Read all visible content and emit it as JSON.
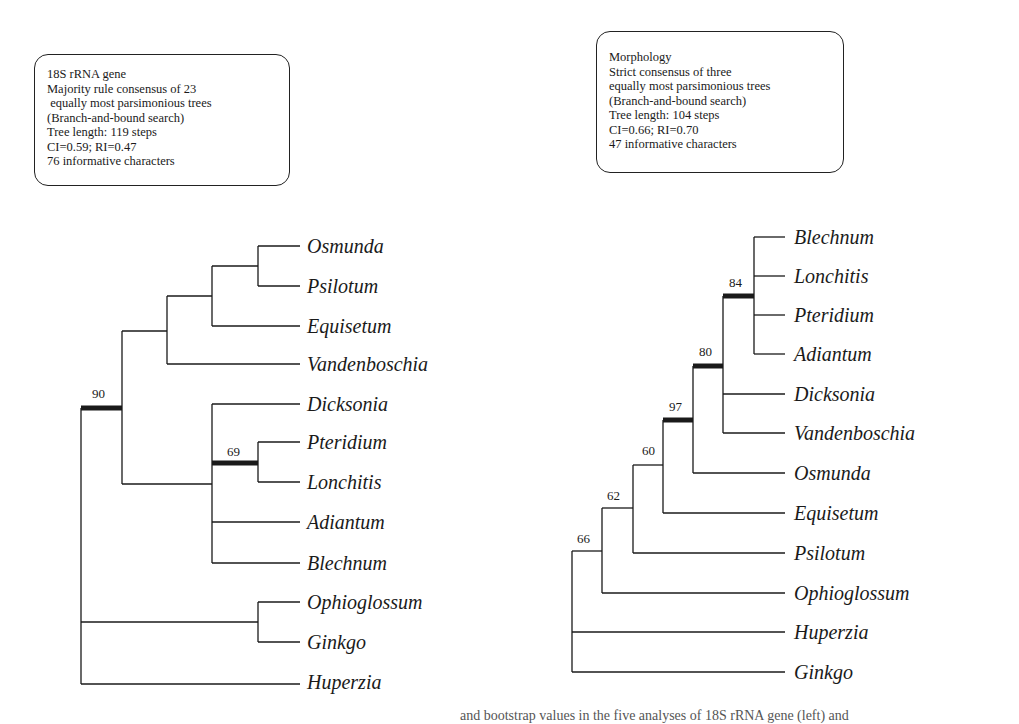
{
  "left_panel": {
    "info_lines": [
      "18S rRNA gene",
      "Majority rule consensus of 23",
      " equally most parsimonious trees",
      "(Branch-and-bound search)",
      "Tree length: 119 steps",
      "CI=0.59; RI=0.47",
      "76 informative characters"
    ],
    "taxa": [
      "Osmunda",
      "Psilotum",
      "Equisetum",
      "Vandenboschia",
      "Dicksonia",
      "Pteridium",
      "Lonchitis",
      "Adiantum",
      "Blechnum",
      "Ophioglossum",
      "Ginkgo",
      "Huperzia"
    ],
    "support_values": [
      {
        "value": "90",
        "clade": "Osmunda, Psilotum, Equisetum, Vandenboschia, Dicksonia, Pteridium, Lonchitis, Adiantum, Blechnum"
      },
      {
        "value": "69",
        "clade": "Pteridium, Lonchitis"
      }
    ],
    "newick": "(((((Osmunda,Psilotum),Equisetum),Vandenboschia),(Dicksonia,(Pteridium,Lonchitis)69,Adiantum,Blechnum))90,(Ophioglossum,Ginkgo),Huperzia);"
  },
  "right_panel": {
    "info_lines": [
      "Morphology",
      "Strict consensus of three",
      "equally most parsimonious trees",
      "(Branch-and-bound search)",
      "Tree length: 104 steps",
      "CI=0.66; RI=0.70",
      "47 informative characters"
    ],
    "taxa": [
      "Blechnum",
      "Lonchitis",
      "Pteridium",
      "Adiantum",
      "Dicksonia",
      "Vandenboschia",
      "Osmunda",
      "Equisetum",
      "Psilotum",
      "Ophioglossum",
      "Huperzia",
      "Ginkgo"
    ],
    "support_values": [
      {
        "value": "84",
        "clade": "Blechnum, Lonchitis, Pteridium, Adiantum"
      },
      {
        "value": "80",
        "clade": "Blechnum, Lonchitis, Pteridium, Adiantum, Dicksonia, Vandenboschia"
      },
      {
        "value": "97",
        "clade": "... + Osmunda"
      },
      {
        "value": "60",
        "clade": "... + Equisetum"
      },
      {
        "value": "62",
        "clade": "... + Psilotum"
      },
      {
        "value": "66",
        "clade": "... + Ophioglossum"
      }
    ],
    "newick": "((((((((Blechnum,Lonchitis,Pteridium,Adiantum)84,Dicksonia,Vandenboschia)80,Osmunda)97,Equisetum)60,Psilotum)62,Ophioglossum)66,Huperzia,Ginkgo);"
  },
  "caption_partial": "and bootstrap values in the five analyses of 18S rRNA gene (left) and"
}
